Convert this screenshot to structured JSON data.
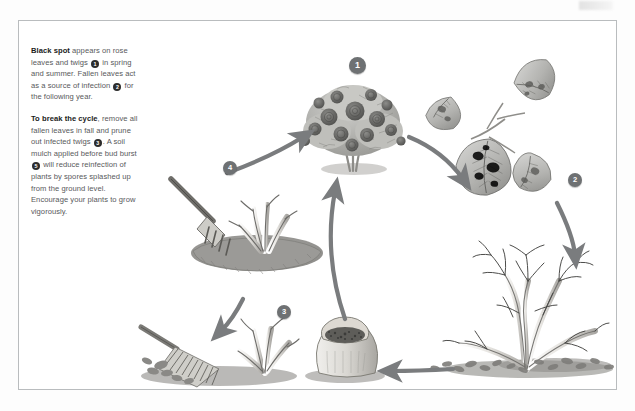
{
  "figure": {
    "type": "illustrated-cycle-diagram",
    "background_color": "#ffffff",
    "border_color": "#b9bcbe",
    "ink_color": "#58595b",
    "badge_color": "#6e7173",
    "arrow_color": "#7a7c7e"
  },
  "text": {
    "para1": {
      "lead": "Black spot",
      "seg_a": " appears on rose leaves and twigs ",
      "marker_a": "1",
      "seg_b": " in spring and summer. Fallen leaves act as a source of infection ",
      "marker_b": "2",
      "seg_c": " for the following year."
    },
    "para2": {
      "lead": "To break the cycle",
      "seg_a": ", remove all fallen leaves in fall and prune out infected twigs ",
      "marker_a": "3",
      "seg_b": ". A soil mulch applied before bud burst ",
      "marker_b": "5",
      "seg_c": " will reduce reinfection of plants by spores splashed up from the ground level. Encourage your plants to grow vigorously."
    }
  },
  "markers": [
    {
      "id": "1",
      "label": "1",
      "meaning": "black spot appears on rose leaves and twigs",
      "x": 330,
      "y": 36
    },
    {
      "id": "2",
      "label": "2",
      "meaning": "fallen leaves act as a source of infection",
      "x": 549,
      "y": 152
    },
    {
      "id": "3",
      "label": "3",
      "meaning": "prune out infected twigs and rake fallen leaves",
      "x": 258,
      "y": 284
    },
    {
      "id": "4",
      "label": "4",
      "meaning": "fork over and clear the bed around the bush",
      "x": 204,
      "y": 140
    }
  ],
  "illustrations": [
    {
      "name": "flowering-rose-bush",
      "caption": "Healthy flowering rose bush in summer",
      "marker": "1"
    },
    {
      "name": "infected-rose-leaves",
      "caption": "Rose leaves showing black spot lesions",
      "marker": "2"
    },
    {
      "name": "bare-rose-bush-fallen-leaves",
      "caption": "Dormant bare rose bush with fallen leaves beneath"
    },
    {
      "name": "mulch-sack",
      "caption": "Sack of soil mulch",
      "marker": "5"
    },
    {
      "name": "rake-and-pruned-twigs",
      "caption": "Rake gathering leaves beside pruned twig stubs",
      "marker": "3"
    },
    {
      "name": "garden-fork-cleared-bed",
      "caption": "Garden fork beside cleared rose bed",
      "marker": "4"
    }
  ],
  "arrows": [
    {
      "name": "arrow-bush-to-leaves",
      "from": "flowering-rose-bush",
      "to": "infected-rose-leaves"
    },
    {
      "name": "arrow-leaves-to-bare-bush",
      "from": "infected-rose-leaves",
      "to": "bare-rose-bush-fallen-leaves"
    },
    {
      "name": "arrow-bare-bush-to-mulch",
      "from": "bare-rose-bush-fallen-leaves",
      "to": "mulch-sack"
    },
    {
      "name": "arrow-mulch-to-bush",
      "from": "mulch-sack",
      "to": "flowering-rose-bush"
    },
    {
      "name": "arrow-twigs-to-fork",
      "from": "rake-and-pruned-twigs",
      "to": "garden-fork-cleared-bed"
    },
    {
      "name": "arrow-fork-to-bush",
      "from": "garden-fork-cleared-bed",
      "to": "flowering-rose-bush"
    }
  ]
}
